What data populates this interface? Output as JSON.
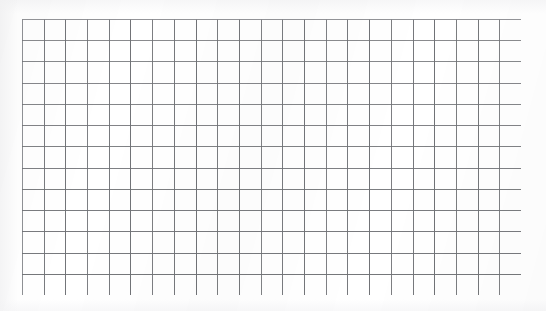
{
  "document": {
    "kind": "blank-grid-sheet",
    "description": "Blank ruled graph-paper grid, no labels or annotations",
    "width": 546,
    "height": 311,
    "background_color": "#ffffff"
  },
  "grid": {
    "columns": 23,
    "rows": 13,
    "left": 22,
    "top": 19,
    "right": 521,
    "bottom": 295,
    "width": 499,
    "height": 276,
    "cell_width": 21.7,
    "cell_height": 21.2,
    "line_color": "#6f7175",
    "line_color_light": "#a9abaf",
    "border_color": "#8a8c90",
    "line_width": 1,
    "cell_fill": "#ffffff"
  },
  "annotations": {
    "title": "",
    "labels": [],
    "text": []
  },
  "chart_data": {
    "type": "table",
    "title": "",
    "xlabel": "",
    "ylabel": "",
    "categories": [],
    "values": [],
    "grid": true,
    "legend": "none",
    "note": "Empty 23 x 13 grid; no plotted data present in the image"
  }
}
